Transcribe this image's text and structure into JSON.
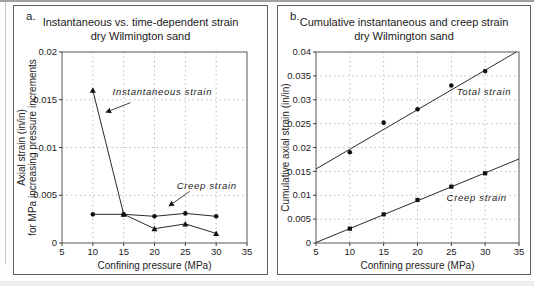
{
  "figure": {
    "background": "#ffffff",
    "ink_color": "#1a1a1a",
    "grid_color": "#b6b6b6"
  },
  "chart_data": [
    {
      "id": "a",
      "type": "line",
      "corner_label": "a.",
      "title": "Instantaneous vs. time-dependent strain",
      "subtitle": "dry Wilmington sand",
      "xlabel": "Confining pressure (MPa)",
      "ylabel_lines": [
        "Axial strain (in/in)",
        "for MPa increasing pressure increments"
      ],
      "xlim": [
        5,
        35
      ],
      "ylim": [
        0,
        0.02
      ],
      "xticks": [
        5,
        10,
        15,
        20,
        25,
        30,
        35
      ],
      "yticks": [
        0,
        0.005,
        0.01,
        0.015,
        0.02
      ],
      "ytick_labels": [
        "0",
        "0.005",
        "0.01",
        "0.015",
        "0.02"
      ],
      "grid": "dotted",
      "legend_position": "none",
      "series": [
        {
          "name": "Instantaneous strain",
          "marker": "triangle",
          "connect": true,
          "points": [
            [
              10,
              0.016
            ],
            [
              15,
              0.003
            ],
            [
              20,
              0.0015
            ],
            [
              25,
              0.002
            ],
            [
              30,
              0.001
            ]
          ]
        },
        {
          "name": "Creep strain",
          "marker": "circle",
          "connect": true,
          "points": [
            [
              10,
              0.003
            ],
            [
              15,
              0.003
            ],
            [
              20,
              0.0028
            ],
            [
              25,
              0.0031
            ],
            [
              30,
              0.0028
            ]
          ]
        }
      ],
      "annotations": [
        {
          "text": "Instantaneous strain",
          "x": 13.2,
          "y": 0.0155,
          "arrow": {
            "from": [
              16.1,
              0.0147
            ],
            "to": [
              12.2,
              0.0137
            ]
          }
        },
        {
          "text": "Creep strain",
          "x": 23.6,
          "y": 0.0057,
          "arrow": {
            "from": [
              25.7,
              0.0054
            ],
            "to": [
              22.4,
              0.0039
            ]
          }
        }
      ]
    },
    {
      "id": "b",
      "type": "scatter",
      "corner_label": "b.",
      "title": "Cumulative instantaneous and creep strain",
      "subtitle": "dry Wilmington sand",
      "xlabel": "Confining pressure (MPa)",
      "ylabel_lines": [
        "Cumulative axial strain (in/in)"
      ],
      "xlim": [
        5,
        35
      ],
      "ylim": [
        0,
        0.04
      ],
      "xticks": [
        5,
        10,
        15,
        20,
        25,
        30,
        35
      ],
      "yticks": [
        0,
        0.005,
        0.01,
        0.015,
        0.02,
        0.025,
        0.03,
        0.035,
        0.04
      ],
      "ytick_labels": [
        "0",
        "0.005",
        "0.01",
        "0.015",
        "0.02",
        "0.025",
        "0.03",
        "0.035",
        "0.04"
      ],
      "grid": "dotted",
      "legend_position": "none",
      "series": [
        {
          "name": "Total strain",
          "marker": "circle",
          "connect": false,
          "points": [
            [
              10,
              0.019
            ],
            [
              15,
              0.0252
            ],
            [
              20,
              0.028
            ],
            [
              25,
              0.033
            ],
            [
              30,
              0.036
            ]
          ],
          "fit_line": [
            [
              5,
              0.0155
            ],
            [
              34.6,
              0.04
            ]
          ]
        },
        {
          "name": "Creep strain",
          "marker": "square",
          "connect": false,
          "points": [
            [
              10,
              0.003
            ],
            [
              15,
              0.006
            ],
            [
              20,
              0.009
            ],
            [
              25,
              0.0118
            ],
            [
              30,
              0.0146
            ]
          ],
          "fit_line": [
            [
              5,
              0.0001
            ],
            [
              35,
              0.0176
            ]
          ]
        }
      ],
      "annotations": [
        {
          "text": "Total strain",
          "x": 25.8,
          "y": 0.031
        },
        {
          "text": "Creep strain",
          "x": 24.3,
          "y": 0.0089
        }
      ]
    }
  ]
}
